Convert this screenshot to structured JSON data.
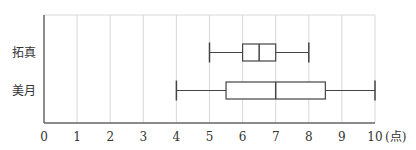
{
  "chart_data": {
    "type": "boxplot",
    "orientation": "horizontal",
    "title": "",
    "xlabel": "",
    "unit_label": "(点)",
    "ylabel": "",
    "xlim": [
      0,
      10
    ],
    "x_ticks": [
      0,
      1,
      2,
      3,
      4,
      5,
      6,
      7,
      8,
      9,
      10
    ],
    "grid": "vertical",
    "legend": "none",
    "series": [
      {
        "name": "拓真",
        "min": 5,
        "q1": 6,
        "median": 6.5,
        "q3": 7,
        "max": 8
      },
      {
        "name": "美月",
        "min": 4,
        "q1": 5.5,
        "median": 7,
        "q3": 8.5,
        "max": 10
      }
    ]
  },
  "colors": {
    "box": "#444444",
    "grid": "#d8d8d8",
    "axis": "#666666",
    "text": "#333333"
  }
}
